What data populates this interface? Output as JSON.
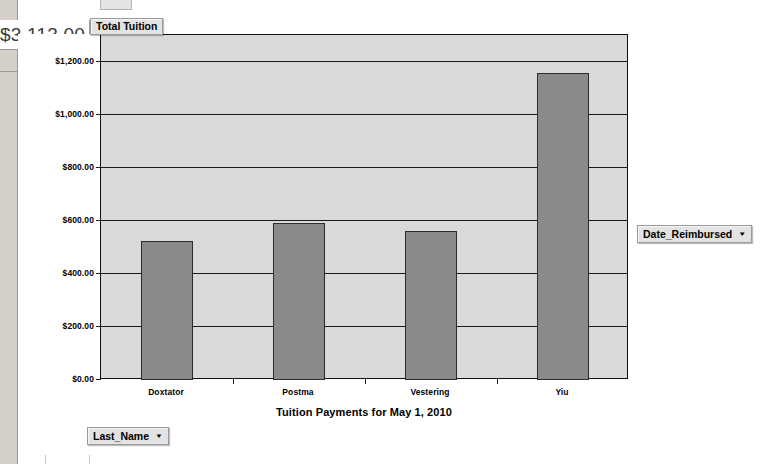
{
  "worksheet": {
    "total_cell_value": "$3,113.00"
  },
  "pivot_fields": {
    "page_field": {
      "label": "Total Tuition",
      "caret": "▼"
    },
    "legend_field": {
      "label": "Date_Reimbursed",
      "caret": "▼"
    },
    "category_field": {
      "label": "Last_Name",
      "caret": "▼"
    }
  },
  "chart_data": {
    "type": "bar",
    "title": "Tuition Payments for May 1, 2010",
    "xlabel": "",
    "ylabel": "",
    "categories": [
      "Doxtator",
      "Postma",
      "Vestering",
      "Yiu"
    ],
    "values": [
      522,
      592,
      563,
      1155
    ],
    "ylim": [
      0,
      1300
    ],
    "ytick_values": [
      0,
      200,
      400,
      600,
      800,
      1000,
      1200
    ],
    "ytick_labels": [
      "$0.00",
      "$200.00",
      "$400.00",
      "$600.00",
      "$800.00",
      "$1,000.00",
      "$1,200.00"
    ],
    "grid": true,
    "legend": false,
    "series": [
      {
        "name": "Total Tuition",
        "values": [
          522,
          592,
          563,
          1155
        ],
        "color": "#8a8a8a"
      }
    ],
    "plot_background": "#d9d9d9",
    "bar_color": "#8a8a8a",
    "bar_border": "#2b2b2b"
  }
}
